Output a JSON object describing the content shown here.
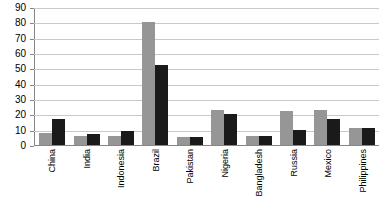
{
  "chart_data": {
    "type": "bar",
    "title": "",
    "xlabel": "",
    "ylabel": "",
    "ylim": [
      0,
      90
    ],
    "ytick_values": [
      0,
      10,
      20,
      30,
      40,
      50,
      60,
      70,
      80,
      90
    ],
    "ytick_labels": [
      "0",
      "10",
      "20",
      "30",
      "40",
      "50",
      "60",
      "70",
      "80",
      "90"
    ],
    "grid": true,
    "legend": "none",
    "categories": [
      "China",
      "India",
      "Indonesia",
      "Brazil",
      "Pakistan",
      "Nigeria",
      "Bangladesh",
      "Russia",
      "Mexico",
      "Philippines"
    ],
    "series": [
      {
        "name": "series-1",
        "color": "#969696",
        "values": [
          8,
          6,
          6,
          80,
          5,
          23,
          6,
          22,
          23,
          11
        ]
      },
      {
        "name": "series-2",
        "color": "#1a1a1a",
        "values": [
          17,
          7,
          9,
          52,
          5,
          20,
          6,
          10,
          17,
          11
        ]
      }
    ]
  },
  "colors": {
    "series_1": "#969696",
    "series_2": "#1a1a1a",
    "gridline": "#c9c9c9",
    "axis": "#868686",
    "text": "#000000",
    "background": "#ffffff"
  }
}
